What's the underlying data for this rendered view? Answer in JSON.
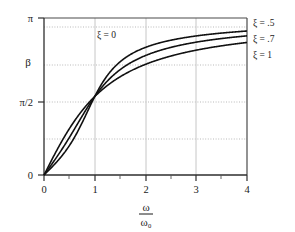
{
  "chart_data": {
    "type": "line",
    "title": "",
    "subtitle": "",
    "xlabel": "ω/ω₀",
    "xlabel_numerator": "ω",
    "xlabel_denominator": "ω₀",
    "ylabel": "β",
    "xlim": [
      0,
      4
    ],
    "ylim": [
      0,
      3.14159
    ],
    "x_ticks": [
      0,
      1,
      2,
      3,
      4
    ],
    "x_tick_labels": [
      "0",
      "1",
      "2",
      "3",
      "4"
    ],
    "x_minor_ticks": [
      0.5,
      1.5,
      2.5,
      3.5
    ],
    "y_ticks": [
      0,
      1.5708,
      3.14159
    ],
    "y_tick_labels": [
      "0",
      "π/2",
      "π"
    ],
    "grid": {
      "horizontal_dotted_at": [
        0.7854,
        1.5708,
        2.35619,
        3.0
      ],
      "vertical_at": [
        1,
        2,
        3
      ],
      "enabled": true
    },
    "legend_position": "right-outside",
    "annotations": [
      {
        "text": "ξ = 0",
        "x": 1.05,
        "y": 2.93
      }
    ],
    "series": [
      {
        "name": "ξ = .5",
        "zeta": 0.5,
        "label_at_right": "ξ = .5",
        "points": [
          [
            0.0,
            0.0
          ],
          [
            0.1,
            0.1007
          ],
          [
            0.2,
            0.2039
          ],
          [
            0.3,
            0.3122
          ],
          [
            0.4,
            0.4287
          ],
          [
            0.5,
            0.588
          ],
          [
            0.6,
            0.7086
          ],
          [
            0.7,
            0.8727
          ],
          [
            0.8,
            1.0637
          ],
          [
            0.9,
            1.278
          ],
          [
            1.0,
            1.5708
          ],
          [
            1.1,
            1.7684
          ],
          [
            1.2,
            1.9656
          ],
          [
            1.3,
            2.131
          ],
          [
            1.4,
            2.2655
          ],
          [
            1.5,
            2.3742
          ],
          [
            1.6,
            2.4631
          ],
          [
            1.8,
            2.5983
          ],
          [
            2.0,
            2.6952
          ],
          [
            2.2,
            2.7669
          ],
          [
            2.4,
            2.8217
          ],
          [
            2.6,
            2.8646
          ],
          [
            2.8,
            2.899
          ],
          [
            3.0,
            2.9271
          ],
          [
            3.2,
            2.9505
          ],
          [
            3.4,
            2.9701
          ],
          [
            3.6,
            2.9869
          ],
          [
            3.8,
            3.0013
          ],
          [
            4.0,
            3.0139
          ]
        ]
      },
      {
        "name": "ξ = .7",
        "zeta": 0.7,
        "label_at_right": "ξ = .7",
        "points": [
          [
            0.0,
            0.0
          ],
          [
            0.1,
            0.1409
          ],
          [
            0.2,
            0.2841
          ],
          [
            0.3,
            0.4321
          ],
          [
            0.4,
            0.5872
          ],
          [
            0.5,
            0.7509
          ],
          [
            0.6,
            0.9234
          ],
          [
            0.7,
            1.103
          ],
          [
            0.8,
            1.2862
          ],
          [
            0.9,
            1.468
          ],
          [
            1.0,
            1.5708
          ],
          [
            1.1,
            1.805
          ],
          [
            1.2,
            1.951
          ],
          [
            1.3,
            2.0772
          ],
          [
            1.4,
            2.1856
          ],
          [
            1.5,
            2.2789
          ],
          [
            1.6,
            2.3594
          ],
          [
            1.8,
            2.4903
          ],
          [
            2.0,
            2.5907
          ],
          [
            2.2,
            2.6692
          ],
          [
            2.4,
            2.7316
          ],
          [
            2.6,
            2.782
          ],
          [
            2.8,
            2.8234
          ],
          [
            3.0,
            2.8578
          ],
          [
            3.2,
            2.8868
          ],
          [
            3.4,
            2.9114
          ],
          [
            3.6,
            2.9326
          ],
          [
            3.8,
            2.951
          ],
          [
            4.0,
            2.9671
          ]
        ]
      },
      {
        "name": "ξ = 1",
        "zeta": 1.0,
        "label_at_right": "ξ = 1",
        "points": [
          [
            0.0,
            0.0
          ],
          [
            0.1,
            0.2013
          ],
          [
            0.2,
            0.4049
          ],
          [
            0.3,
            0.6107
          ],
          [
            0.4,
            0.8176
          ],
          [
            0.5,
            1.0238
          ],
          [
            0.6,
            1.2271
          ],
          [
            0.7,
            1.4254
          ],
          [
            0.8,
            1.5708
          ],
          [
            0.9,
            1.68
          ],
          [
            1.0,
            1.5708
          ],
          [
            1.1,
            1.7604
          ],
          [
            1.2,
            1.9022
          ],
          [
            1.3,
            2.023
          ],
          [
            1.4,
            2.1257
          ],
          [
            1.5,
            2.2143
          ],
          [
            1.6,
            2.2915
          ],
          [
            1.8,
            2.419
          ],
          [
            2.0,
            2.5191
          ],
          [
            2.2,
            2.5991
          ],
          [
            2.4,
            2.6641
          ],
          [
            2.6,
            2.7176
          ],
          [
            2.8,
            2.7622
          ],
          [
            3.0,
            2.7999
          ],
          [
            3.2,
            2.832
          ],
          [
            3.4,
            2.8597
          ],
          [
            3.6,
            2.8837
          ],
          [
            3.8,
            2.9048
          ],
          [
            4.0,
            2.9234
          ]
        ]
      }
    ]
  },
  "axes": {
    "y_label_text": "β",
    "y_tick_top": "π",
    "y_tick_mid": "π/2",
    "y_tick_bottom": "0",
    "x_tick_0": "0",
    "x_tick_1": "1",
    "x_tick_2": "2",
    "x_tick_3": "3",
    "x_tick_4": "4"
  },
  "labels": {
    "zeta_zero": "ξ = 0",
    "zeta_half": "ξ = .5",
    "zeta_seven": "ξ = .7",
    "zeta_one": "ξ = 1"
  },
  "colors": {
    "background": "#ffffff",
    "curve": "#111111",
    "axis": "#555555",
    "grid": "#bbbbbb",
    "text": "#1a1a1a"
  }
}
